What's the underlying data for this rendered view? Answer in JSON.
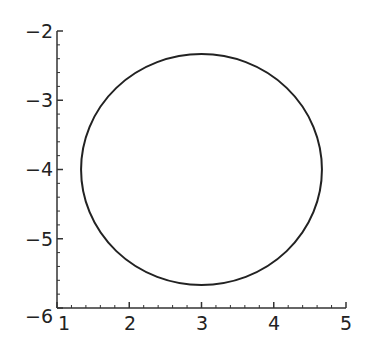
{
  "chart_data": {
    "type": "line",
    "title": "",
    "xlabel": "",
    "ylabel": "",
    "xlim": [
      1,
      5
    ],
    "ylim": [
      -6,
      -2
    ],
    "grid": false,
    "legend": null,
    "x_ticks": [
      "1",
      "2",
      "3",
      "4",
      "5"
    ],
    "y_ticks": [
      "-6",
      "-5",
      "-4",
      "-3",
      "-2"
    ],
    "series": [
      {
        "name": "circle",
        "shape": "circle",
        "center": [
          3,
          -4
        ],
        "radius": 1.667,
        "color": "#222222"
      }
    ]
  },
  "labels": {
    "x": [
      "1",
      "2",
      "3",
      "4",
      "5"
    ],
    "y": [
      "−6",
      "−5",
      "−4",
      "−3",
      "−2"
    ]
  }
}
